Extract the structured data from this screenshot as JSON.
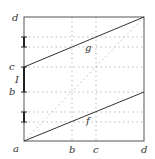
{
  "diagram": {
    "labels": {
      "y_d": "d",
      "y_c": "c",
      "y_I": "I",
      "y_b": "b",
      "x_a": "a",
      "x_b": "b",
      "x_c": "c",
      "x_d": "d",
      "g": "g",
      "f": "f"
    },
    "colors": {
      "frame": "#555555",
      "lines": "#333333",
      "dotted": "#aaaaaa",
      "interval": "#222222"
    }
  }
}
